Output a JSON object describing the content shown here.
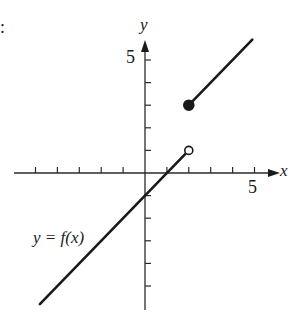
{
  "chart_data": {
    "type": "line",
    "title": "",
    "xlabel": "x",
    "ylabel": "y",
    "function_label": "y = f(x)",
    "corner_mark": ":",
    "tick_labels": {
      "x": [
        "5"
      ],
      "y": [
        "5"
      ]
    },
    "xlim": [
      -6,
      6
    ],
    "ylim": [
      -6,
      6
    ],
    "tick_spacing": 1,
    "grid": false,
    "legend": "none",
    "series": [
      {
        "name": "left piece",
        "equation": "y = x - 1",
        "x": [
          -4.8,
          2
        ],
        "y": [
          -5.8,
          1
        ],
        "left_endpoint": "none",
        "right_endpoint": "open"
      },
      {
        "name": "right piece",
        "equation": "y = x + 1",
        "x": [
          2,
          4.9
        ],
        "y": [
          3,
          5.9
        ],
        "left_endpoint": "closed",
        "right_endpoint": "none"
      }
    ],
    "points": [
      {
        "x": 2,
        "y": 1,
        "style": "open"
      },
      {
        "x": 2,
        "y": 3,
        "style": "filled"
      }
    ]
  },
  "colors": {
    "ink": "#1a1a1a",
    "background": "#ffffff"
  }
}
